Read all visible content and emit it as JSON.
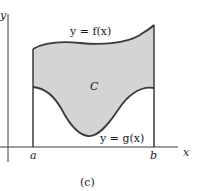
{
  "figure": {
    "caption": "(c)",
    "region_label": "C",
    "upper_curve_label": "y = f(x)",
    "lower_curve_label": "y = g(x)",
    "x_axis_label": "x",
    "y_axis_label": "y",
    "left_bound_label": "a",
    "right_bound_label": "b",
    "colors": {
      "region_fill": "#d4d4d4",
      "stroke": "#3a3a3a"
    }
  }
}
